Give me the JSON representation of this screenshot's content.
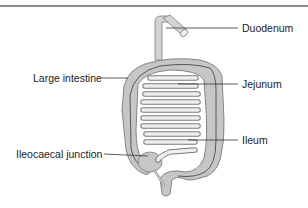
{
  "diagram": {
    "labels": {
      "duodenum": "Duodenum",
      "large_intestine": "Large intestine",
      "jejunum": "Jejunum",
      "ileum": "Ileum",
      "ileocaecal_junction": "Ileocaecal junction"
    },
    "colors": {
      "tissue_fill": "#c4c4c4",
      "tissue_light": "#dcdcdc",
      "outline": "#7a7a7a",
      "leader_line": "#333333",
      "top_rule": "#8a8a8a"
    }
  }
}
